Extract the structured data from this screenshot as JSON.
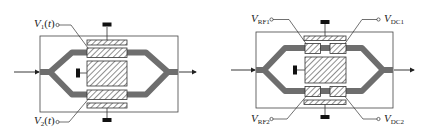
{
  "colors": {
    "waveguide": "#6e6e6e",
    "outline": "#333333",
    "electrode_fill": "#ffffff",
    "hatch": "#444444",
    "ground": "#111111",
    "background": "#ffffff"
  },
  "left_diagram": {
    "title": "Dual-drive Mach-Zehnder modulator",
    "label_v1": {
      "main": "V",
      "sub": "1",
      "suffix": "(t)"
    },
    "label_v2": {
      "main": "V",
      "sub": "2",
      "suffix": "(t)"
    }
  },
  "right_diagram": {
    "title": "Mach-Zehnder modulator with separate RF and DC electrodes",
    "label_rf1": {
      "main": "V",
      "sub": "RF1"
    },
    "label_rf2": {
      "main": "V",
      "sub": "RF2"
    },
    "label_dc1": {
      "main": "V",
      "sub": "DC1"
    },
    "label_dc2": {
      "main": "V",
      "sub": "DC2"
    }
  }
}
